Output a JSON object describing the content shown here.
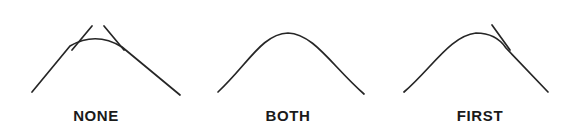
{
  "figure": {
    "background_color": "#ffffff",
    "stroke_color": "#262626",
    "label_color": "#1a1a1a",
    "width": 576,
    "height": 139
  },
  "chart_data": {
    "type": "diagram",
    "title": "",
    "panel_count": 3,
    "panels": [
      {
        "label": "NONE",
        "blend_mode": "none",
        "blended_ends": [],
        "overshoot_sides": [
          "left",
          "right"
        ],
        "apex": [
          96,
          34
        ],
        "left_end": [
          32,
          92
        ],
        "right_end": [
          180,
          95
        ],
        "arc_path": "M 32 92 L 70 46 Q 96 31 122 47 L 180 95",
        "overshoot_left_path": "M 92 26 L 72 50",
        "overshoot_right_path": "M 104 26 L 124 50"
      },
      {
        "label": "BOTH",
        "blend_mode": "both",
        "blended_ends": [
          "first",
          "second"
        ],
        "overshoot_sides": [],
        "apex": [
          96,
          32
        ],
        "left_end": [
          26,
          92
        ],
        "right_end": [
          172,
          94
        ],
        "arc_path": "M 26 92 C 56 64 70 34 96 33 C 122 34 140 66 172 94",
        "overshoot_left_path": "",
        "overshoot_right_path": ""
      },
      {
        "label": "FIRST",
        "blend_mode": "first",
        "blended_ends": [
          "first"
        ],
        "overshoot_sides": [
          "right"
        ],
        "apex": [
          96,
          33
        ],
        "left_end": [
          20,
          92
        ],
        "right_end": [
          164,
          92
        ],
        "arc_path": "M 20 92 C 48 68 66 36 92 33 Q 112 33 122 48 L 164 92",
        "overshoot_left_path": "",
        "overshoot_right_path": "M 108 25 L 126 50"
      }
    ],
    "labels": [
      "NONE",
      "BOTH",
      "FIRST"
    ],
    "legend": [],
    "xlabel": "",
    "ylabel": ""
  }
}
